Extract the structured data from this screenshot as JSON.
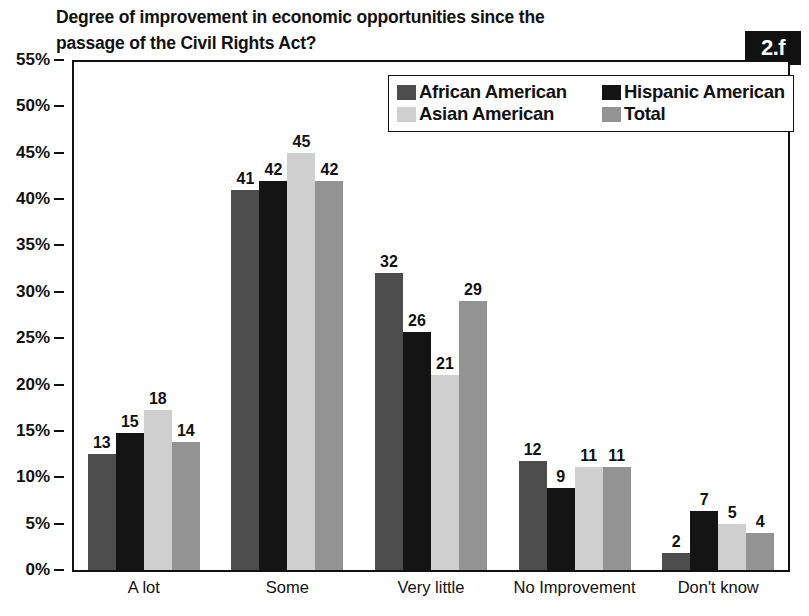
{
  "title": {
    "line1": "Degree of improvement in economic opportunities since the",
    "line2": "passage of the Civil Rights Act?"
  },
  "badge": {
    "label": "2.f"
  },
  "legend": {
    "position": "top-right-inside",
    "entries": [
      {
        "label": "African American",
        "color": "#4d4d4d"
      },
      {
        "label": "Hispanic American",
        "color": "#141414"
      },
      {
        "label": "Asian American",
        "color": "#cfcfcf"
      },
      {
        "label": "Total",
        "color": "#939393"
      }
    ]
  },
  "chart_data": {
    "type": "bar",
    "title": "Degree of improvement in economic opportunities since the passage of the Civil Rights Act?",
    "xlabel": "",
    "ylabel": "",
    "ylim": [
      0,
      55
    ],
    "ytick_step": 5,
    "ytick_labels": [
      "0%",
      "5%",
      "10%",
      "15%",
      "20%",
      "25%",
      "30%",
      "35%",
      "40%",
      "45%",
      "50%",
      "55%"
    ],
    "grid": false,
    "value_label_suffix": "",
    "categories": [
      "A lot",
      "Some",
      "Very little",
      "No Improvement",
      "Don't know"
    ],
    "series": [
      {
        "name": "African American",
        "color": "#4d4d4d",
        "values": [
          13,
          41,
          32,
          12,
          2
        ]
      },
      {
        "name": "Hispanic American",
        "color": "#141414",
        "values": [
          15,
          42,
          26,
          9,
          7
        ]
      },
      {
        "name": "Asian American",
        "color": "#cfcfcf",
        "values": [
          18,
          45,
          21,
          11,
          5
        ]
      },
      {
        "name": "Total",
        "color": "#939393",
        "values": [
          14,
          42,
          29,
          11,
          4
        ]
      }
    ],
    "bar_heights_percent": [
      [
        12.5,
        41.0,
        32.0,
        11.8,
        1.8
      ],
      [
        14.8,
        42.0,
        25.7,
        8.8,
        6.4
      ],
      [
        17.3,
        45.0,
        21.0,
        11.1,
        5.0
      ],
      [
        13.8,
        42.0,
        29.0,
        11.1,
        4.0
      ]
    ]
  }
}
